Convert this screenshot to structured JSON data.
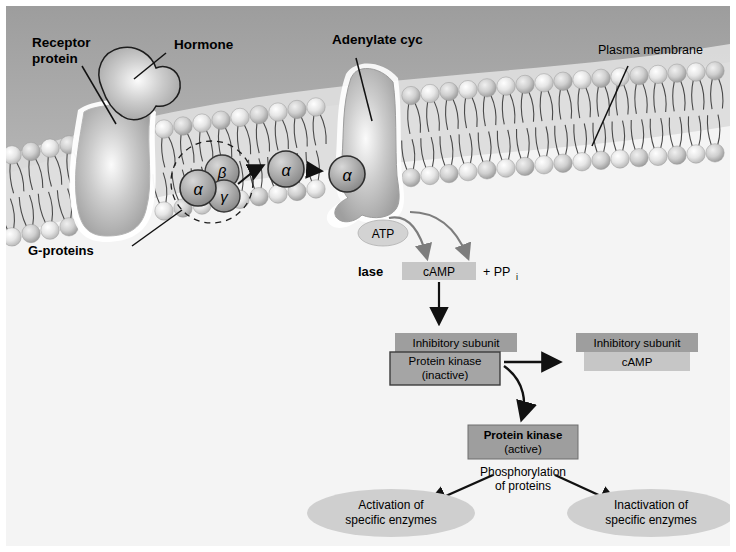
{
  "figure": {
    "title_labels": {
      "receptor_protein": "Receptor\nprotein",
      "receptor_protein_line1": "Receptor",
      "receptor_protein_line2": "protein",
      "hormone": "Hormone",
      "adenylate_cyclase_top": "Adenylate cyc",
      "adenylate_cyclase_bottom": "lase",
      "plasma_membrane": "Plasma membrane",
      "g_proteins": "G-proteins"
    },
    "subunits": {
      "alpha": "α",
      "beta": "β",
      "gamma": "γ",
      "alpha_migrating_1": "α",
      "alpha_migrating_2": "α"
    },
    "molecules": {
      "atp": "ATP",
      "camp": "cAMP",
      "pyrophosphate": "+ PP",
      "pyrophosphate_sub": "i"
    },
    "kinase_inactive": {
      "inhibitory_subunit": "Inhibitory subunit",
      "name": "Protein kinase",
      "state": "(inactive)"
    },
    "kinase_released": {
      "inhibitory_subunit": "Inhibitory subunit",
      "bound_camp": "cAMP"
    },
    "kinase_active": {
      "name": "Protein kinase",
      "state": "(active)"
    },
    "phosphorylation": {
      "line1": "Phosphorylation",
      "line2": "of proteins"
    },
    "outcomes": [
      {
        "line1": "Activation of",
        "line2": "specific enzymes"
      },
      {
        "line1": "Inactivation of",
        "line2": "specific enzymes"
      }
    ],
    "colors": {
      "extracellular": "#a8a8a8",
      "cytoplasm": "#f4f4f4",
      "membrane_band": "#d8d8d8",
      "protein_fill": "#a5a5a5",
      "box_dark": "#9e9e9e",
      "box_light": "#c6c6c6",
      "ellipse_fill": "#cfcfcf",
      "arrow_gray": "#808080",
      "stroke_dark": "#2b2b2b"
    }
  }
}
